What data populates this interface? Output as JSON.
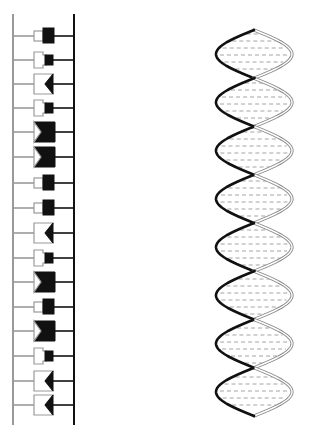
{
  "figure": {
    "colors": {
      "light_strand": "#9a9a9a",
      "dark_strand": "#111111",
      "background": "#ffffff"
    }
  },
  "ladder": {
    "left_rail_x": 13,
    "right_rail_x": 74,
    "top_y": 14,
    "bottom_y": 425,
    "rungs": [
      {
        "y": 36,
        "pair": "square-small/block-tall"
      },
      {
        "y": 60,
        "pair": "rect/square-small"
      },
      {
        "y": 84,
        "pair": "notch/chevron"
      },
      {
        "y": 108,
        "pair": "rect/square-small"
      },
      {
        "y": 132,
        "pair": "chevron/notch-block"
      },
      {
        "y": 157,
        "pair": "chevron/notch-block"
      },
      {
        "y": 183,
        "pair": "square-small/block-tall"
      },
      {
        "y": 208,
        "pair": "square-small/block-tall"
      },
      {
        "y": 233,
        "pair": "notch/chevron"
      },
      {
        "y": 258,
        "pair": "rect/square-small"
      },
      {
        "y": 282,
        "pair": "chevron/notch-block"
      },
      {
        "y": 307,
        "pair": "square-small/block-tall"
      },
      {
        "y": 331,
        "pair": "chevron/notch-block"
      },
      {
        "y": 356,
        "pair": "rect/square-small"
      },
      {
        "y": 381,
        "pair": "notch/chevron"
      },
      {
        "y": 405,
        "pair": "notch/chevron"
      }
    ]
  },
  "helix": {
    "x_left": 216,
    "x_right": 292,
    "top_y": 30,
    "bottom_y": 416,
    "half_turns": 8
  }
}
